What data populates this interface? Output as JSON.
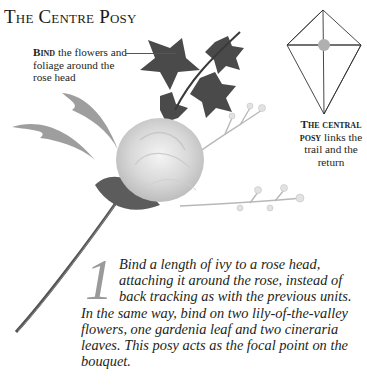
{
  "page": {
    "title": "The Centre Posy"
  },
  "annotations": {
    "bind": {
      "lead": "Bind",
      "text": " the flowers and foliage around the rose head"
    },
    "central": {
      "lead": "The central posy",
      "text": " links the trail and the return"
    }
  },
  "diagram": {
    "shape": "kite-outline",
    "highlight_color": "#b0b0b0",
    "line_color": "#333333"
  },
  "step": {
    "number": "1",
    "text": "Bind a length of ivy to a rose head, attaching it around the rose, instead of back tracking as with the previous units. In the same way, bind on two lily-of-the-valley flowers, one gardenia leaf and two cineraria leaves. This posy acts as the focal point on the bouquet."
  },
  "illustration": {
    "subject": "rose-posy-photo",
    "elements": [
      "rose-head",
      "ivy",
      "lily-of-the-valley",
      "gardenia-leaf",
      "cineraria-leaves",
      "stem"
    ]
  }
}
